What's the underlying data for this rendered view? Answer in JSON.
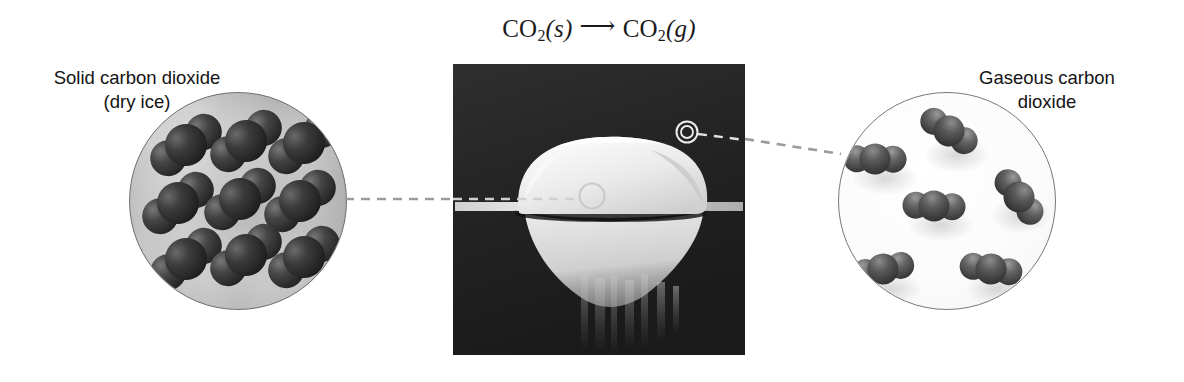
{
  "figure": {
    "background_color": "#ffffff"
  },
  "equation": {
    "reactant_formula": "CO",
    "reactant_subscript": "2",
    "reactant_state": "(s)",
    "arrow": "⟶",
    "product_formula": "CO",
    "product_subscript": "2",
    "product_state": "(g)",
    "full_text": "CO2(s) ⟶ CO2(g)",
    "text_color": "#1b1b1b"
  },
  "captions": {
    "left": {
      "line1": "Solid carbon dioxide",
      "line2": "(dry ice)"
    },
    "right": {
      "line1": "Gaseous carbon",
      "line2": "dioxide"
    }
  },
  "insets": {
    "solid": {
      "label": "solid-state-molecular-view",
      "description": "Ordered close-packed lattice of carbon dioxide molecules",
      "molecule_count": 9,
      "arrangement": "regular 3x3 crystal lattice, molecules touching",
      "background_color": "#a3a3a3",
      "molecule_color": "#2e2e2e",
      "border_color": "#6f6f6f"
    },
    "gas": {
      "label": "gas-state-molecular-view",
      "description": "Widely separated carbon dioxide molecules in random orientations",
      "molecule_count": 6,
      "arrangement": "random positions and orientations, large gaps between molecules",
      "background_color": "#ffffff",
      "molecule_color": "#4a4a4a",
      "border_color": "#787878"
    }
  },
  "photo": {
    "label": "dry-ice-photograph",
    "description": "Block of dry ice sublimating with white vapor, dark background",
    "callouts": [
      {
        "name": "solid-region-callout",
        "style": "single-ring",
        "color": "#c9c9c9"
      },
      {
        "name": "gas-region-callout",
        "style": "double-ring",
        "color": "#e8e8e8"
      }
    ]
  },
  "leaders": {
    "left": {
      "name": "leader-line-solid",
      "style": "dashed",
      "color": "#9b9b9b"
    },
    "right": {
      "name": "leader-line-gas",
      "style": "dashed",
      "color": "#9b9b9b"
    }
  },
  "colors": {
    "page_background": "#ffffff",
    "text": "#131313",
    "leader_line": "#9b9b9b",
    "photo_dark": "#262626",
    "photo_ice": "#f2f2f2"
  }
}
